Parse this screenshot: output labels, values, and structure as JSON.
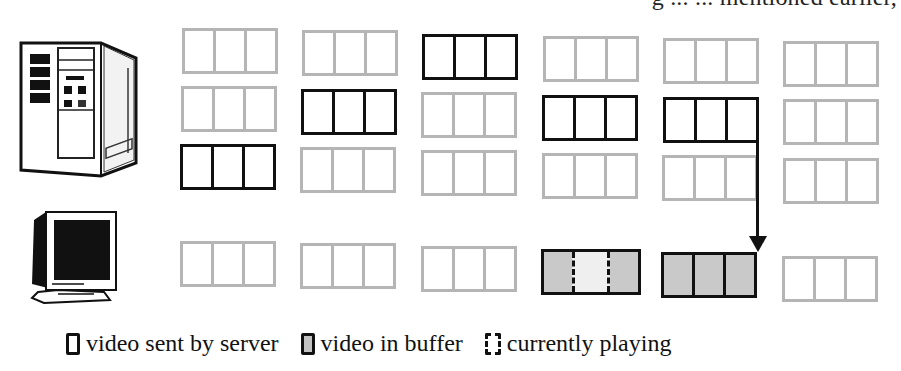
{
  "header": {
    "clipped_text": "g ... ... mentioned earlier,"
  },
  "icons": {
    "server": "server-tower-icon",
    "client": "crt-monitor-icon"
  },
  "colors": {
    "sent_border": "#111111",
    "idle_border": "#b5b5b5",
    "buffer_fill": "#c9c9c9",
    "playing_fill": "#efefef",
    "background": "#ffffff"
  },
  "server_grid": {
    "columns": 6,
    "rows": 3,
    "blocks": [
      {
        "col": 0,
        "row": 0,
        "state": "idle"
      },
      {
        "col": 1,
        "row": 0,
        "state": "idle"
      },
      {
        "col": 2,
        "row": 0,
        "state": "sent"
      },
      {
        "col": 3,
        "row": 0,
        "state": "idle"
      },
      {
        "col": 4,
        "row": 0,
        "state": "idle"
      },
      {
        "col": 5,
        "row": 0,
        "state": "idle"
      },
      {
        "col": 0,
        "row": 1,
        "state": "idle"
      },
      {
        "col": 1,
        "row": 1,
        "state": "sent"
      },
      {
        "col": 2,
        "row": 1,
        "state": "idle"
      },
      {
        "col": 3,
        "row": 1,
        "state": "sent"
      },
      {
        "col": 4,
        "row": 1,
        "state": "sent"
      },
      {
        "col": 5,
        "row": 1,
        "state": "idle"
      },
      {
        "col": 0,
        "row": 2,
        "state": "sent"
      },
      {
        "col": 1,
        "row": 2,
        "state": "idle"
      },
      {
        "col": 2,
        "row": 2,
        "state": "idle"
      },
      {
        "col": 3,
        "row": 2,
        "state": "idle"
      },
      {
        "col": 4,
        "row": 2,
        "state": "idle"
      },
      {
        "col": 5,
        "row": 2,
        "state": "idle"
      }
    ]
  },
  "client_row": {
    "blocks": [
      {
        "col": 0,
        "state": "idle"
      },
      {
        "col": 1,
        "state": "idle"
      },
      {
        "col": 2,
        "state": "idle"
      },
      {
        "col": 3,
        "state": "buffer-playing"
      },
      {
        "col": 4,
        "state": "buffer"
      },
      {
        "col": 5,
        "state": "idle"
      }
    ]
  },
  "arrow": {
    "from": "server block col 4 row 1 (right edge)",
    "to": "client block col 4 (top-right corner)"
  },
  "legend": {
    "items": [
      {
        "swatch": "sent",
        "label": "video sent by server"
      },
      {
        "swatch": "buffer",
        "label": "video in buffer"
      },
      {
        "swatch": "playing",
        "label": "currently playing"
      }
    ]
  }
}
